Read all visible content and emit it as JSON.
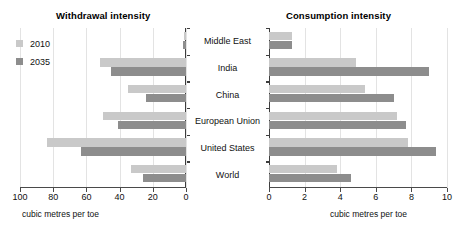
{
  "chart_data": {
    "type": "bar",
    "orientation": "horizontal",
    "title": "",
    "panels": [
      {
        "key": "withdrawal",
        "title": "Withdrawal intensity",
        "xlabel": "cubic metres per toe",
        "xlim": [
          100,
          0
        ],
        "reversed": true,
        "ticks": [
          100,
          80,
          60,
          40,
          20,
          0
        ],
        "tick_labels": [
          "100",
          "80",
          "60",
          "40",
          "20",
          "0"
        ],
        "grid": true,
        "categories": [
          "Middle East",
          "India",
          "China",
          "European Union",
          "United States",
          "World"
        ],
        "series": [
          {
            "name": "2010",
            "color": "#c9c9c9",
            "values": [
              1.5,
              52,
              35,
              50,
              84,
              33
            ]
          },
          {
            "name": "2035",
            "color": "#8d8d8d",
            "values": [
              2.0,
              45,
              24,
              41,
              63,
              26
            ]
          }
        ]
      },
      {
        "key": "consumption",
        "title": "Consumption intensity",
        "xlabel": "cubic metres per toe",
        "xlim": [
          0,
          10
        ],
        "reversed": false,
        "ticks": [
          0,
          2,
          4,
          6,
          8,
          10
        ],
        "tick_labels": [
          "0",
          "2",
          "4",
          "6",
          "8",
          "10"
        ],
        "grid": true,
        "categories": [
          "Middle East",
          "India",
          "China",
          "European Union",
          "United States",
          "World"
        ],
        "series": [
          {
            "name": "2010",
            "color": "#c9c9c9",
            "values": [
              1.3,
              4.9,
              5.4,
              7.2,
              7.8,
              3.8
            ]
          },
          {
            "name": "2035",
            "color": "#8d8d8d",
            "values": [
              1.3,
              9.0,
              7.0,
              7.7,
              9.4,
              4.6
            ]
          }
        ]
      }
    ],
    "legend": {
      "position": "top-left",
      "entries": [
        {
          "label": "2010",
          "color": "#c9c9c9"
        },
        {
          "label": "2035",
          "color": "#8d8d8d"
        }
      ]
    }
  },
  "legend": {
    "entry_2010": "2010",
    "entry_2035": "2035"
  },
  "left_panel": {
    "title": "Withdrawal intensity",
    "caption": "cubic metres per toe"
  },
  "right_panel": {
    "title": "Consumption intensity",
    "caption": "cubic metres per toe"
  }
}
